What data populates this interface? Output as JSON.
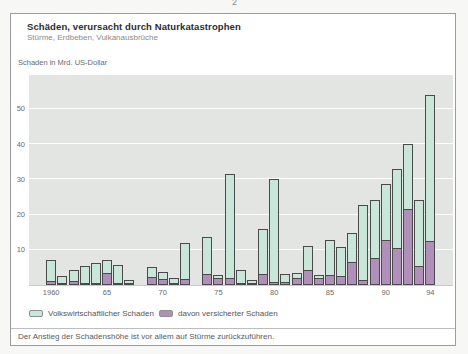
{
  "page": {
    "page_number": "2"
  },
  "header": {
    "title": "Schäden, verursacht durch Naturkatastrophen",
    "subtitle": "Stürme, Erdbeben, Vulkanausbrüche"
  },
  "axis": {
    "y_title": "Schaden in Mrd. US-Dollar"
  },
  "chart_data": {
    "type": "bar",
    "stacked_overlay": true,
    "title": "Schäden, verursacht durch Naturkatastrophen",
    "subtitle": "Stürme, Erdbeben, Vulkanausbrüche",
    "ylabel": "Schaden in Mrd. US-Dollar",
    "xlabel": "",
    "ylim": [
      0,
      59.6
    ],
    "grid": true,
    "plot_bg": "#e3e5e2",
    "grid_color": "#ffffff",
    "bar_outline": "#4a4a4a",
    "x": [
      1960,
      1961,
      1962,
      1963,
      1964,
      1965,
      1966,
      1967,
      1968,
      1969,
      1970,
      1971,
      1972,
      1973,
      1974,
      1975,
      1976,
      1977,
      1978,
      1979,
      1980,
      1981,
      1982,
      1983,
      1984,
      1985,
      1986,
      1987,
      1988,
      1989,
      1990,
      1991,
      1992,
      1993,
      1994
    ],
    "series": [
      {
        "name": "Volkswirtschaftlicher Schaden",
        "color": "#c9e7d8",
        "values": [
          7.0,
          2.5,
          4.2,
          5.3,
          6.3,
          7.2,
          5.8,
          1.5,
          0,
          5.2,
          3.6,
          2.1,
          11.9,
          0,
          13.5,
          2.8,
          31.5,
          4.3,
          1.5,
          15.9,
          30.0,
          3.0,
          3.5,
          11.2,
          2.9,
          12.8,
          10.9,
          14.7,
          22.7,
          24.0,
          28.8,
          33.0,
          40.0,
          24.0,
          53.9
        ]
      },
      {
        "name": "davon versicherter Schaden",
        "color": "#b090ba",
        "values": [
          1.0,
          0.4,
          1.2,
          0.3,
          0.4,
          3.5,
          0.4,
          0.2,
          0,
          2.2,
          1.6,
          0.4,
          1.6,
          0,
          3.2,
          1.9,
          2.1,
          0.4,
          0.2,
          3.0,
          0.9,
          0.9,
          1.9,
          4.3,
          2.0,
          2.9,
          2.7,
          6.6,
          1.5,
          7.8,
          12.8,
          10.5,
          21.5,
          5.5,
          12.6
        ]
      }
    ],
    "yticks": [
      10,
      20,
      30,
      40,
      50
    ],
    "ytick_labels": [
      "10",
      "20",
      "30",
      "40",
      "50"
    ],
    "xticks": [
      {
        "index": 0,
        "label": "1960"
      },
      {
        "index": 5,
        "label": "65"
      },
      {
        "index": 10,
        "label": "70"
      },
      {
        "index": 15,
        "label": "75"
      },
      {
        "index": 20,
        "label": "80"
      },
      {
        "index": 25,
        "label": "85"
      },
      {
        "index": 30,
        "label": "90"
      },
      {
        "index": 34,
        "label": "94"
      }
    ],
    "legend_position": "bottom-left"
  },
  "legend": {
    "items": [
      {
        "label": "Volkswirtschaftlicher Schaden",
        "color": "#c9e7d8"
      },
      {
        "label": "davon versicherter Schaden",
        "color": "#b090ba"
      }
    ]
  },
  "footer": {
    "note": "Der Anstieg der Schadenshöhe ist vor allem auf Stürme zurückzuführen."
  }
}
